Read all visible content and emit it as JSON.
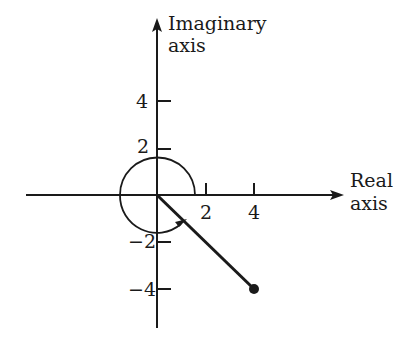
{
  "diagram": {
    "type": "complex-plane",
    "axes": {
      "x_label_line1": "Real",
      "x_label_line2": "axis",
      "y_label_line1": "Imaginary",
      "y_label_line2": "axis"
    },
    "ticks": {
      "x": [
        {
          "value": 2,
          "label": "2"
        },
        {
          "value": 4,
          "label": "4"
        }
      ],
      "y": [
        {
          "value": 4,
          "label": "4"
        },
        {
          "value": 2,
          "label": "2"
        },
        {
          "value": -2,
          "label": "−2"
        },
        {
          "value": -4,
          "label": "−4"
        }
      ]
    },
    "vector": {
      "from": [
        0,
        0
      ],
      "to": [
        4,
        -4
      ],
      "endpoint_marker": "filled-dot"
    },
    "arc": {
      "center": [
        0,
        0
      ],
      "radius": 1.5,
      "start_angle_deg": 0,
      "end_angle_deg": 315,
      "direction": "counterclockwise",
      "arrow": "at-end"
    },
    "colors": {
      "ink": "#1a1a1a",
      "background": "#ffffff"
    }
  }
}
